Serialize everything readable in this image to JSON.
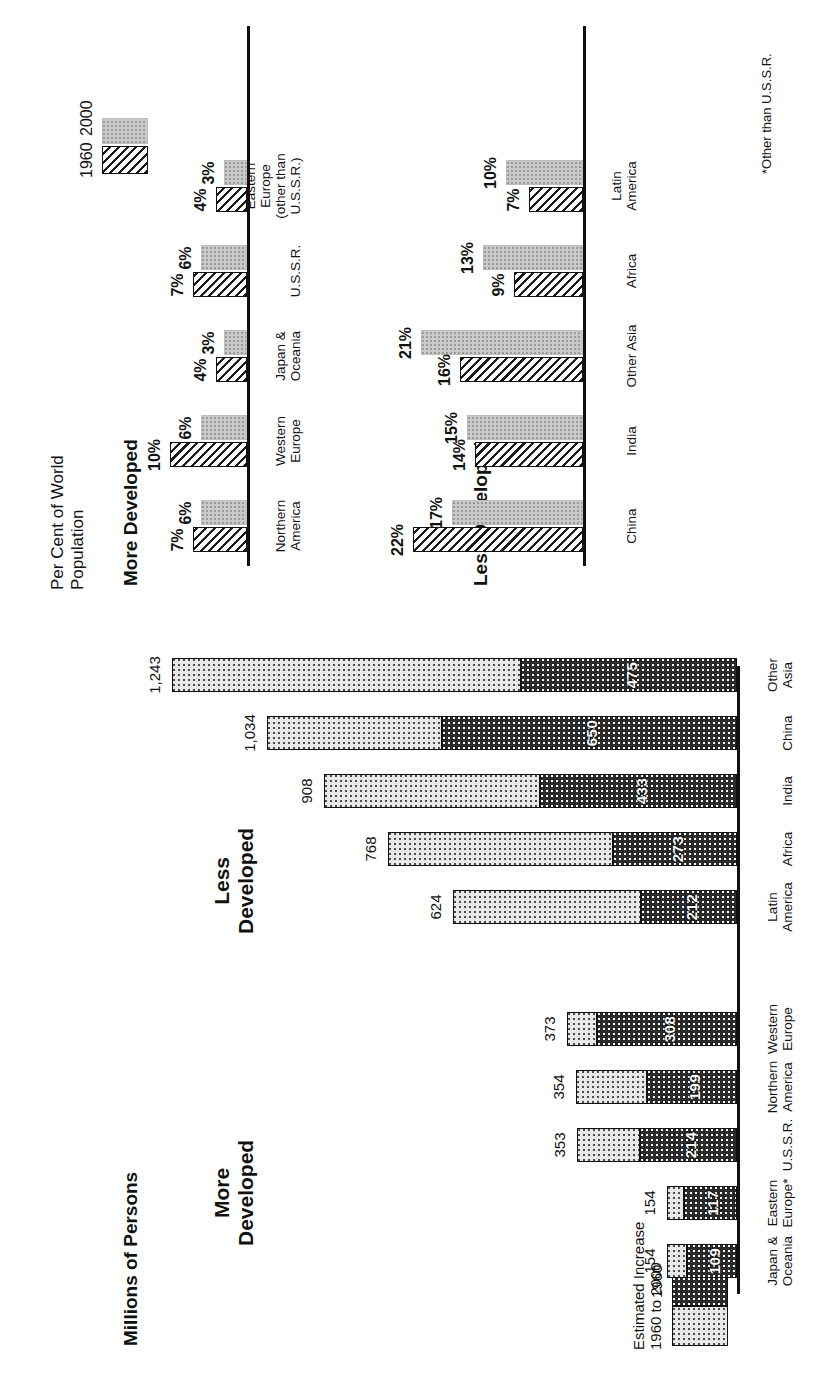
{
  "figure": {
    "left_chart": {
      "axis_title": "Millions of Persons",
      "group_more": "More\nDeveloped",
      "group_less": "Less\nDeveloped",
      "legend": {
        "increase_label": "Estimated Increase\n1960 to 2000",
        "base_label": "1960"
      }
    },
    "right_chart": {
      "axis_title": "Per Cent of World\nPopulation",
      "group_more": "More Developed",
      "group_less": "Less Developed",
      "legend": {
        "series1": "1960",
        "series2": "2000"
      },
      "footnote": "*Other than U.S.S.R."
    }
  },
  "chart_data": [
    {
      "type": "bar",
      "id": "millions-of-persons",
      "title": "Millions of Persons",
      "orientation": "horizontal-stacked",
      "xlabel": "",
      "ylabel": "Millions of Persons",
      "grid": false,
      "legend_position": "bottom-left",
      "series": [
        {
          "name": "1960",
          "key": "base"
        },
        {
          "name": "Estimated Increase 1960 to 2000",
          "key": "increase"
        }
      ],
      "groups": [
        {
          "name": "More Developed",
          "categories": [
            "Japan &\nOceania",
            "Eastern\nEurope*",
            "U.S.S.R.",
            "Northern\nAmerica",
            "Western\nEurope"
          ],
          "base": [
            109,
            117,
            214,
            199,
            308
          ],
          "totals": [
            154,
            154,
            353,
            354,
            373
          ],
          "base_labels": [
            "109",
            "117",
            "214",
            "199",
            "308"
          ],
          "total_labels": [
            "154",
            "154",
            "353",
            "354",
            "373"
          ]
        },
        {
          "name": "Less Developed",
          "categories": [
            "Latin\nAmerica",
            "Africa",
            "India",
            "China",
            "Other\nAsia"
          ],
          "base": [
            212,
            273,
            433,
            650,
            475
          ],
          "totals": [
            624,
            768,
            908,
            1034,
            1243
          ],
          "base_labels": [
            "212",
            "273",
            "433",
            "650",
            "475"
          ],
          "total_labels": [
            "624",
            "768",
            "908",
            "1,034",
            "1,243"
          ]
        }
      ],
      "xlim": [
        0,
        1320
      ]
    },
    {
      "type": "bar",
      "id": "per-cent-of-world-population",
      "title": "Per Cent of World Population",
      "orientation": "vertical-grouped",
      "xlabel": "",
      "ylabel": "Per Cent of World Population",
      "grid": false,
      "legend_position": "top-right",
      "series": [
        {
          "name": "1960",
          "style": "hatched"
        },
        {
          "name": "2000",
          "style": "grey-stipple"
        }
      ],
      "groups": [
        {
          "name": "More Developed",
          "categories": [
            "Northern\nAmerica",
            "Western\nEurope",
            "Japan &\nOceania",
            "U.S.S.R.",
            "Eastern Europe\n(other than U.S.S.R.)"
          ],
          "values_1960": [
            7,
            10,
            4,
            7,
            4
          ],
          "values_2000": [
            6,
            6,
            3,
            6,
            3
          ],
          "labels_1960": [
            "7%",
            "10%",
            "4%",
            "7%",
            "4%"
          ],
          "labels_2000": [
            "6%",
            "6%",
            "3%",
            "6%",
            "3%"
          ]
        },
        {
          "name": "Less Developed",
          "categories": [
            "China",
            "India",
            "Other Asia",
            "Africa",
            "Latin\nAmerica"
          ],
          "values_1960": [
            22,
            14,
            16,
            9,
            7
          ],
          "values_2000": [
            17,
            15,
            21,
            13,
            10
          ],
          "labels_1960": [
            "22%",
            "14%",
            "16%",
            "9%",
            "7%"
          ],
          "labels_2000": [
            "17%",
            "15%",
            "21%",
            "13%",
            "10%"
          ]
        }
      ],
      "ylim": [
        0,
        24
      ],
      "footnote": "*Other than U.S.S.R."
    }
  ]
}
